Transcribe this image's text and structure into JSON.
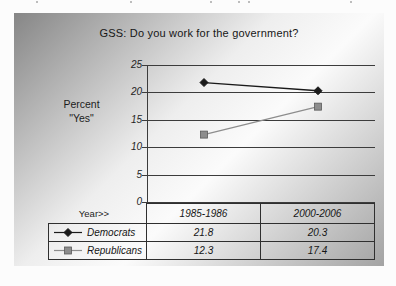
{
  "chart_data": {
    "type": "line",
    "title": "GSS: Do you work for the government?",
    "ylabel_lines": [
      "Percent",
      "\"Yes\""
    ],
    "x_axis_row_label": "Year>>",
    "categories": [
      "1985-1986",
      "2000-2006"
    ],
    "series": [
      {
        "name": "Democrats",
        "values": [
          21.8,
          20.3
        ],
        "color": "#1a1a1a",
        "marker": "diamond"
      },
      {
        "name": "Republicans",
        "values": [
          12.3,
          17.4
        ],
        "color": "#8d8d8d",
        "marker": "square"
      }
    ],
    "ylim": [
      0,
      25
    ],
    "yticks": [
      0,
      5,
      10,
      15,
      20,
      25
    ],
    "grid": true,
    "gridline_color": "#3c3c3c",
    "legend_position": "table-left",
    "background_gradient": [
      "#868686",
      "#eeeeee",
      "#fbfbfb",
      "#a3a3a3"
    ]
  }
}
